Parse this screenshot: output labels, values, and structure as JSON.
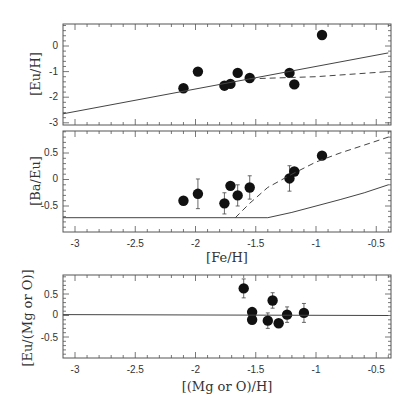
{
  "chart_data": [
    {
      "type": "scatter",
      "panel": "top",
      "title": "",
      "xlabel": "",
      "ylabel": "[Eu/H]",
      "xlim": [
        -3.1,
        -0.4
      ],
      "ylim": [
        -3,
        0.9
      ],
      "xticks": [
        -3,
        -2.5,
        -2,
        -1.5,
        -1,
        -0.5
      ],
      "yticks": [
        "0",
        "-1",
        "-2",
        "-3"
      ],
      "grid": false,
      "series": [
        {
          "name": "observations",
          "style": "filled-circle",
          "x": [
            -2.1,
            -1.98,
            -1.76,
            -1.71,
            -1.65,
            -1.55,
            -1.22,
            -1.18,
            -0.95
          ],
          "y": [
            -1.65,
            -1.0,
            -1.55,
            -1.48,
            -1.05,
            -1.25,
            -1.05,
            -1.5,
            0.43
          ],
          "yerr": [
            0.0,
            0.15,
            0.0,
            0.0,
            0.0,
            0.0,
            0.0,
            0.0,
            0.0
          ]
        },
        {
          "name": "model-solid",
          "style": "solid-line",
          "x": [
            -3.1,
            -0.4
          ],
          "y": [
            -2.65,
            -0.27
          ]
        },
        {
          "name": "model-dashed",
          "style": "dashed-line",
          "x": [
            -1.55,
            -1.0,
            -0.4
          ],
          "y": [
            -1.28,
            -1.2,
            -1.0
          ]
        }
      ]
    },
    {
      "type": "scatter",
      "panel": "middle",
      "title": "",
      "xlabel": "[Fe/H]",
      "ylabel": "[Ba/Eu]",
      "xlim": [
        -3.1,
        -0.4
      ],
      "ylim": [
        -0.95,
        0.95
      ],
      "xticks": [
        "-3",
        "-2.5",
        "-2",
        "-1.5",
        "-1",
        "-0.5"
      ],
      "yticks": [
        "0.5",
        "0",
        "-0.5"
      ],
      "grid": false,
      "series": [
        {
          "name": "observations",
          "style": "filled-circle",
          "x": [
            -2.1,
            -1.98,
            -1.76,
            -1.71,
            -1.65,
            -1.55,
            -1.22,
            -1.18,
            -0.95
          ],
          "y": [
            -0.4,
            -0.27,
            -0.45,
            -0.12,
            -0.3,
            -0.15,
            0.02,
            0.15,
            0.45
          ],
          "yerr": [
            0.0,
            0.28,
            0.2,
            0.0,
            0.2,
            0.22,
            0.24,
            0.0,
            0.05
          ]
        },
        {
          "name": "model-solid",
          "style": "solid-line",
          "x": [
            -3.1,
            -1.4,
            -1.2,
            -1.0,
            -0.8,
            -0.6,
            -0.4
          ],
          "y": [
            -0.72,
            -0.72,
            -0.62,
            -0.5,
            -0.38,
            -0.25,
            -0.1
          ]
        },
        {
          "name": "model-dashed",
          "style": "dashed-line",
          "x": [
            -1.67,
            -1.55,
            -1.4,
            -1.2,
            -1.0,
            -0.8,
            -0.6,
            -0.4
          ],
          "y": [
            -0.72,
            -0.45,
            -0.15,
            0.1,
            0.33,
            0.5,
            0.65,
            0.8
          ]
        }
      ]
    },
    {
      "type": "scatter",
      "panel": "bottom",
      "title": "",
      "xlabel": "[(Mg or O)/H]",
      "ylabel": "[Eu/(Mg or O)]",
      "xlim": [
        -3.1,
        -0.4
      ],
      "ylim": [
        -0.95,
        0.95
      ],
      "xticks": [
        "-3",
        "-2.5",
        "-2",
        "-1.5",
        "-1",
        "-0.5"
      ],
      "yticks": [
        "0.5",
        "0",
        "-0.5"
      ],
      "grid": false,
      "series": [
        {
          "name": "observations",
          "style": "filled-circle",
          "x": [
            -1.6,
            -1.53,
            -1.53,
            -1.36,
            -1.4,
            -1.31,
            -1.24,
            -1.1
          ],
          "y": [
            0.63,
            0.08,
            -0.1,
            0.35,
            -0.12,
            -0.18,
            0.02,
            0.06
          ],
          "yerr": [
            0.22,
            0.0,
            0.0,
            0.18,
            0.18,
            0.0,
            0.18,
            0.22
          ]
        },
        {
          "name": "model-solid",
          "style": "solid-line",
          "x": [
            -3.1,
            -0.4
          ],
          "y": [
            0.02,
            0.0
          ]
        }
      ]
    }
  ],
  "labels": {
    "panel1_ylabel": "[Eu/H]",
    "panel2_ylabel": "[Ba/Eu]",
    "panel2_xlabel": "[Fe/H]",
    "panel3_ylabel": "[Eu/(Mg or O)]",
    "panel3_xlabel": "[(Mg or O)/H]",
    "p1_yticks": [
      "0",
      "-1",
      "-2",
      "-3"
    ],
    "p2_yticks": [
      "0.5",
      "0",
      "-0.5"
    ],
    "p3_yticks": [
      "0.5",
      "0",
      "-0.5"
    ],
    "xticks": [
      "-3",
      "-2.5",
      "-2",
      "-1.5",
      "-1",
      "-0.5"
    ]
  }
}
